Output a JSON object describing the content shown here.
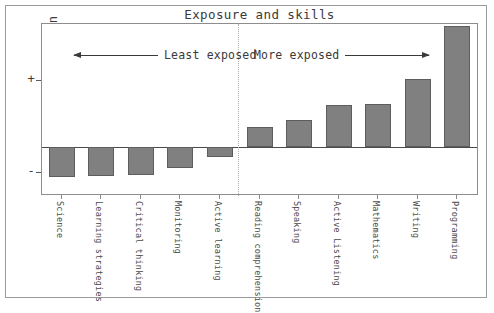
{
  "figure": {
    "title": "Exposure and skills",
    "bar_color": "#808080",
    "bar_edge_color": "#5d5d5d",
    "frame_color": "#8d8d8d",
    "text_color": "#3a3a3a"
  },
  "axes": {
    "ylabel": "Correlation",
    "ytick_plus": "+",
    "ytick_minus": "-"
  },
  "annotations": {
    "left": "Least exposed",
    "right": "More exposed"
  },
  "chart_data": {
    "type": "bar",
    "title": "Exposure and skills",
    "xlabel": "",
    "ylabel": "Correlation",
    "ylim": [
      -0.45,
      0.9
    ],
    "grid": false,
    "legend": "none",
    "orientation": "vertical",
    "zero_line": true,
    "categories": [
      "Science",
      "Learning strategies",
      "Critical thinking",
      "Monitoring",
      "Active learning",
      "Reading comprehension",
      "Speaking",
      "Active Listening",
      "Mathematics",
      "Writing",
      "Programming"
    ],
    "values": [
      -0.29,
      -0.275,
      -0.265,
      -0.2,
      -0.095,
      0.145,
      0.195,
      0.305,
      0.315,
      0.5,
      0.885
    ],
    "groups": [
      {
        "name": "Least exposed",
        "categories": [
          "Science",
          "Learning strategies",
          "Critical thinking",
          "Monitoring",
          "Active learning"
        ]
      },
      {
        "name": "More exposed",
        "categories": [
          "Reading comprehension",
          "Speaking",
          "Active Listening",
          "Mathematics",
          "Writing",
          "Programming"
        ]
      }
    ],
    "annotations": [
      {
        "text": "Least exposed",
        "arrow": "left"
      },
      {
        "text": "More exposed",
        "arrow": "right"
      }
    ],
    "ytick_labels": [
      "+",
      "-"
    ]
  }
}
